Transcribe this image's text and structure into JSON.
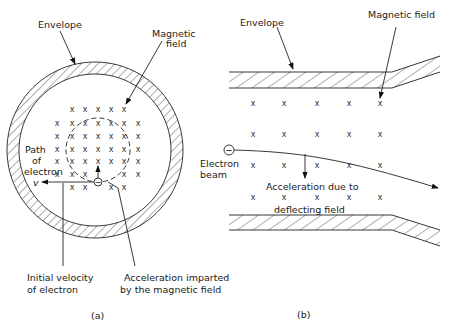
{
  "panel_a": {
    "caption": "(a)",
    "labels": {
      "envelope": "Envelope",
      "magnetic_field_1": "Magnetic",
      "magnetic_field_2": "field",
      "path_1": "Path",
      "path_2": "of",
      "path_3": "electron",
      "velocity_symbol": "v",
      "initial_velocity_1": "Initial velocity",
      "initial_velocity_2": "of electron",
      "acceleration_1": "Acceleration imparted",
      "acceleration_2": "by the magnetic field"
    },
    "field_marker": "x",
    "electron_symbol": "−"
  },
  "panel_b": {
    "caption": "(b)",
    "labels": {
      "envelope": "Envelope",
      "magnetic_field": "Magnetic field",
      "electron_1": "Electron",
      "electron_2": "beam",
      "acceleration_1": "Acceleration due to",
      "acceleration_2": "deflecting field"
    },
    "field_marker": "x",
    "electron_symbol": "−"
  }
}
